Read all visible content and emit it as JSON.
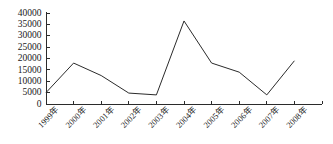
{
  "chart_data": {
    "type": "line",
    "title": "",
    "subtitle": "",
    "xlabel": "",
    "ylabel": "",
    "categories": [
      "1999年",
      "2000年",
      "2001年",
      "2002年",
      "2003年",
      "2004年",
      "2005年",
      "2006年",
      "2007年",
      "2008年"
    ],
    "values": [
      5000,
      18000,
      12500,
      4800,
      4000,
      36500,
      18000,
      14000,
      4000,
      19000
    ],
    "series": [
      {
        "name": "",
        "values": [
          5000,
          18000,
          12500,
          4800,
          4000,
          36500,
          18000,
          14000,
          4000,
          19000
        ]
      }
    ],
    "ylim": [
      0,
      40000
    ],
    "ytick_values": [
      0,
      5000,
      10000,
      15000,
      20000,
      25000,
      30000,
      35000,
      40000
    ],
    "ytick_labels": [
      "0",
      "5000",
      "10000",
      "15000",
      "20000",
      "25000",
      "30000",
      "35000",
      "40000"
    ],
    "grid": false,
    "legend": false,
    "legend_position": "none",
    "markers": false,
    "line_color": "#2b2b2b",
    "axis_color": "#2b2b2b",
    "background_color": "#ffffff",
    "xtick_rotation_deg": 45
  }
}
